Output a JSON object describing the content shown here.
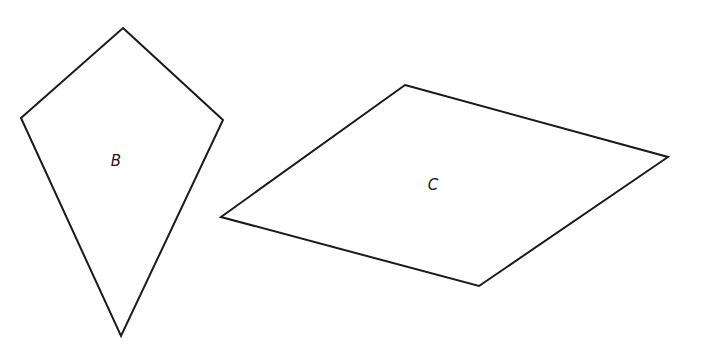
{
  "diagram": {
    "shapes": [
      {
        "id": "B",
        "type": "kite",
        "label": "B",
        "points": [
          [
            123,
            28
          ],
          [
            223,
            120
          ],
          [
            121,
            336
          ],
          [
            21,
            118
          ]
        ],
        "label_pos": [
          116,
          166
        ]
      },
      {
        "id": "C",
        "type": "rhombus",
        "label": "C",
        "points": [
          [
            405,
            85
          ],
          [
            668,
            157
          ],
          [
            479,
            286
          ],
          [
            221,
            217
          ]
        ],
        "label_pos": [
          433,
          190
        ]
      }
    ],
    "stroke_color": "#1a1a1a",
    "background": "#ffffff"
  }
}
